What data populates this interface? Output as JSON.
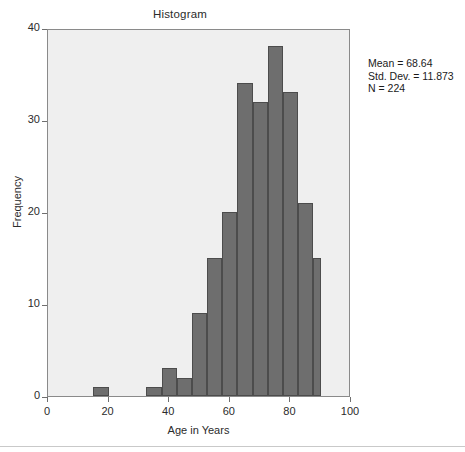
{
  "chart_data": {
    "type": "bar",
    "title": "Histogram",
    "xlabel": "Age in Years",
    "ylabel": "Frequency",
    "xlim": [
      0,
      100
    ],
    "ylim": [
      0,
      40
    ],
    "grid": false,
    "legend": "none",
    "bin_width": 5,
    "x_ticks": [
      0,
      20,
      40,
      60,
      80,
      100
    ],
    "y_ticks": [
      0,
      10,
      20,
      30,
      40
    ],
    "x_tick_labels": [
      "0",
      "20",
      "40",
      "60",
      "80",
      "100"
    ],
    "y_tick_labels": [
      "0",
      "10",
      "20",
      "30",
      "40"
    ],
    "bin_starts": [
      15,
      32.5,
      37.5,
      42.5,
      47.5,
      52.5,
      57.5,
      62.5,
      67.5,
      72.5,
      77.5,
      82.5,
      87.5
    ],
    "bin_ends": [
      20,
      37.5,
      42.5,
      47.5,
      52.5,
      57.5,
      62.5,
      67.5,
      72.5,
      77.5,
      82.5,
      87.5,
      90
    ],
    "categories": [
      "15-20",
      "32.5-37.5",
      "37.5-42.5",
      "42.5-47.5",
      "47.5-52.5",
      "52.5-57.5",
      "57.5-62.5",
      "62.5-67.5",
      "67.5-72.5",
      "72.5-77.5",
      "77.5-82.5",
      "82.5-87.5",
      "87.5-90"
    ],
    "values": [
      1,
      1,
      3,
      2,
      9,
      15,
      20,
      34,
      32,
      38,
      33,
      21,
      15
    ],
    "bar_color": "#6e6e6e",
    "bar_edge_color": "#4c4c4c",
    "plot_background": "#efefef",
    "annotations": {
      "mean_label": "Mean = 68.64",
      "std_dev_label": "Std. Dev. = 11.873",
      "n_label": "N = 224",
      "mean": 68.64,
      "std_dev": 11.873,
      "n": 224
    }
  }
}
